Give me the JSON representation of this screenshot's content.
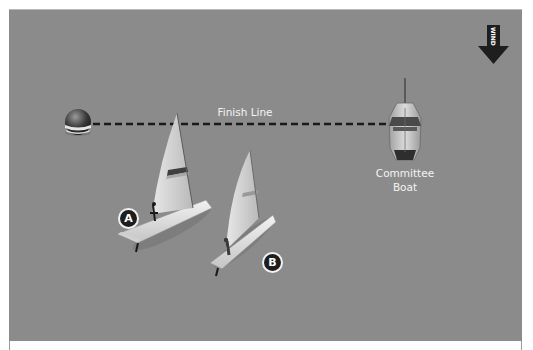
{
  "diagram": {
    "colors": {
      "water": "#8b8b8b",
      "label_text": "#f4f4f4",
      "finish_line": "#1a1a1a",
      "wind_arrow": "#1e1e1e",
      "badge_fill": "#1e1e1e"
    },
    "wind": {
      "label": "WIND",
      "direction": "down",
      "icon": "wind-arrow-icon"
    },
    "finish_line": {
      "label": "Finish Line",
      "style": "dashed"
    },
    "pin_end": {
      "icon": "buoy-icon"
    },
    "committee_boat": {
      "label_line1": "Committee",
      "label_line2": "Boat",
      "icon": "committee-boat-icon"
    },
    "boats": [
      {
        "id": "A",
        "label": "A",
        "icon": "sailboat-icon"
      },
      {
        "id": "B",
        "label": "B",
        "icon": "sailboat-icon"
      }
    ]
  }
}
